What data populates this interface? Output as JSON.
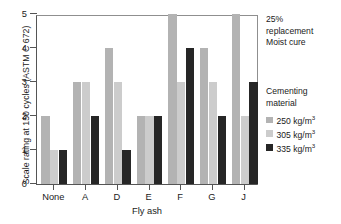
{
  "chart_data": {
    "type": "bar",
    "title": "",
    "subtitle": "",
    "xlabel": "Fly ash",
    "ylabel": "Scale rating at 150 cycles (ASTM C 672)",
    "categories": [
      "None",
      "A",
      "D",
      "E",
      "F",
      "G",
      "J"
    ],
    "series": [
      {
        "name": "250 kg/m3",
        "label": "250 kg/m",
        "exponent": "3",
        "color": "#b3b3b3",
        "values": [
          2,
          3,
          4,
          2,
          5,
          4,
          5
        ]
      },
      {
        "name": "305 kg/m3",
        "label": "305 kg/m",
        "exponent": "3",
        "color": "#cccccc",
        "values": [
          1,
          3,
          3,
          2,
          3,
          3,
          2
        ]
      },
      {
        "name": "335 kg/m3",
        "label": "335 kg/m",
        "exponent": "3",
        "color": "#262626",
        "values": [
          1,
          2,
          1,
          2,
          4,
          2,
          3
        ]
      }
    ],
    "ylim": [
      0,
      5
    ],
    "yticks": [
      0,
      1,
      2,
      3,
      4,
      5
    ],
    "ytick_labels": [
      "0",
      "1",
      "2",
      "3",
      "4",
      "5"
    ],
    "grid": false,
    "legend_position": "right",
    "legend_title_lines": [
      "Cementing",
      "material"
    ],
    "annotation_lines": [
      "25%",
      "replacement",
      "Moist cure"
    ]
  },
  "colors": {
    "series_250": "#b3b3b3",
    "series_305": "#cccccc",
    "series_335": "#262626",
    "axis": "#555555",
    "text": "#1a1a1a",
    "background": "#ffffff"
  }
}
